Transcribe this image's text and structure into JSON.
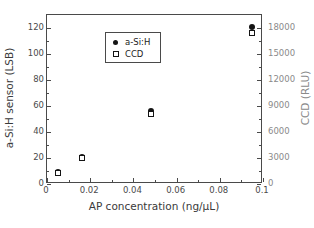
{
  "chart_data": {
    "type": "scatter",
    "title": "",
    "xlabel": "AP concentration (ng/µL)",
    "ylabel": "a-Si:H sensor (LSB)",
    "y2label": "CCD (RLU)",
    "xlim": [
      0,
      0.1
    ],
    "ylim": [
      0,
      130
    ],
    "y2lim": [
      0,
      19500
    ],
    "grid": false,
    "legend_position": "top-left",
    "xticks": [
      0,
      0.02,
      0.04,
      0.06,
      0.08,
      0.1
    ],
    "xticklabels": [
      "0",
      "0.02",
      "0.04",
      "0.06",
      "0.08",
      "0.1"
    ],
    "yticks": [
      0,
      20,
      40,
      60,
      80,
      100,
      120
    ],
    "yticklabels": [
      "0",
      "20",
      "40",
      "60",
      "80",
      "100",
      "120"
    ],
    "y2ticks": [
      0,
      3000,
      6000,
      9000,
      12000,
      15000,
      18000
    ],
    "y2ticklabels": [
      "0",
      "3000",
      "6000",
      "9000",
      "12000",
      "15000",
      "18000"
    ],
    "x": [
      0.005,
      0.016,
      0.048,
      0.095
    ],
    "series": [
      {
        "name": "a-Si:H",
        "marker": "filled-circle",
        "axis": "left",
        "color": "#141414",
        "values": [
          9.5,
          20.5,
          56,
          121
        ]
      },
      {
        "name": "CCD",
        "marker": "open-square",
        "axis": "right",
        "color": "#141414",
        "values": [
          1250,
          3050,
          8100,
          17400
        ]
      }
    ]
  },
  "legend": {
    "entries": [
      {
        "label": "a-Si:H",
        "marker": "filled-circle"
      },
      {
        "label": "CCD",
        "marker": "open-square"
      }
    ]
  }
}
